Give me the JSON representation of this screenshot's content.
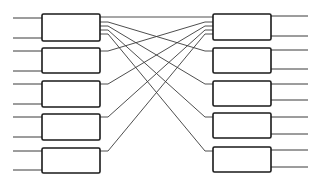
{
  "diagram": {
    "type": "interconnect-network",
    "colors": {
      "stroke": "#1a1a1a",
      "wire": "#3a3a3a",
      "background": "#ffffff"
    },
    "left_blocks": [
      {
        "id": "L1",
        "x": 42,
        "y": 14,
        "w": 58,
        "h": 27,
        "inputs_y": [
          18,
          38
        ]
      },
      {
        "id": "L2",
        "x": 42,
        "y": 48,
        "w": 58,
        "h": 25,
        "inputs_y": [
          51,
          71
        ]
      },
      {
        "id": "L3",
        "x": 42,
        "y": 81,
        "w": 58,
        "h": 26,
        "inputs_y": [
          84,
          104
        ]
      },
      {
        "id": "L4",
        "x": 42,
        "y": 114,
        "w": 58,
        "h": 26,
        "inputs_y": [
          117,
          137
        ]
      },
      {
        "id": "L5",
        "x": 42,
        "y": 148,
        "w": 58,
        "h": 25,
        "inputs_y": [
          151,
          170
        ]
      }
    ],
    "right_blocks": [
      {
        "id": "R1",
        "x": 213,
        "y": 14,
        "w": 58,
        "h": 26,
        "outputs_y": [
          16,
          36
        ]
      },
      {
        "id": "R2",
        "x": 213,
        "y": 48,
        "w": 58,
        "h": 25,
        "outputs_y": [
          50,
          69
        ]
      },
      {
        "id": "R3",
        "x": 213,
        "y": 81,
        "w": 58,
        "h": 25,
        "outputs_y": [
          84,
          100
        ]
      },
      {
        "id": "R4",
        "x": 213,
        "y": 113,
        "w": 58,
        "h": 25,
        "outputs_y": [
          117,
          134
        ]
      },
      {
        "id": "R5",
        "x": 213,
        "y": 147,
        "w": 58,
        "h": 25,
        "outputs_y": [
          150,
          167
        ]
      }
    ],
    "io_line_extent": {
      "left_start_x": 13,
      "right_end_x": 308
    },
    "connections": [
      {
        "from": "L1",
        "to": "R1",
        "from_y": 17,
        "to_y": 17
      },
      {
        "from": "L1",
        "to": "R2",
        "from_y": 22,
        "to_y": 51
      },
      {
        "from": "L1",
        "to": "R3",
        "from_y": 26,
        "to_y": 84
      },
      {
        "from": "L1",
        "to": "R4",
        "from_y": 30,
        "to_y": 117
      },
      {
        "from": "L1",
        "to": "R5",
        "from_y": 34,
        "to_y": 151
      },
      {
        "from": "L2",
        "to": "R1",
        "from_y": 51,
        "to_y": 22
      },
      {
        "from": "L3",
        "to": "R1",
        "from_y": 84,
        "to_y": 26
      },
      {
        "from": "L4",
        "to": "R1",
        "from_y": 117,
        "to_y": 30
      },
      {
        "from": "L5",
        "to": "R1",
        "from_y": 151,
        "to_y": 34
      }
    ]
  }
}
